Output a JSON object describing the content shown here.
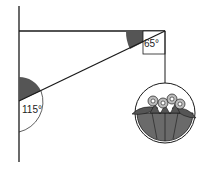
{
  "diagram": {
    "angles": {
      "bracket_top_angle": "65°",
      "wall_angle": "115°"
    },
    "colors": {
      "line": "#1a1a1a",
      "shade": "#555555",
      "basket_fill": "#6a6a6a",
      "flower": "#bbbbbb"
    }
  }
}
